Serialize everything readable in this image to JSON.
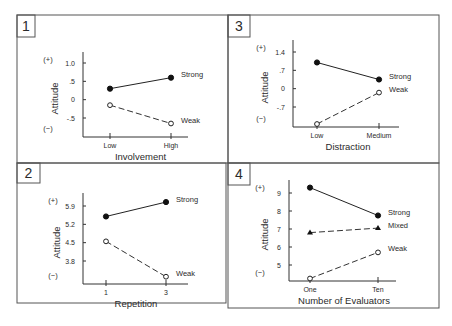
{
  "chart_data": [
    {
      "panel": "1",
      "type": "line",
      "categories": [
        "Low",
        "High"
      ],
      "xlabel": "Involvement",
      "ylabel": "Attitude",
      "y_pos_label": "(+)",
      "y_neg_label": "(−)",
      "yticks": [
        1.0,
        0.5,
        0,
        -0.5
      ],
      "ytick_labels": [
        "1.0",
        ".5",
        "0",
        "-.5"
      ],
      "ylim": [
        -0.85,
        1.4
      ],
      "series": [
        {
          "name": "Strong",
          "values": [
            0.3,
            0.6
          ],
          "marker": "filled-circle",
          "line": "solid"
        },
        {
          "name": "Weak",
          "values": [
            -0.15,
            -0.65
          ],
          "marker": "open-circle",
          "line": "dashed"
        }
      ]
    },
    {
      "panel": "3",
      "type": "line",
      "categories": [
        "Low",
        "Medium"
      ],
      "xlabel": "Distraction",
      "ylabel": "Attitude",
      "y_pos_label": "(+)",
      "y_neg_label": "(−)",
      "yticks": [
        1.4,
        0.7,
        0,
        -0.7
      ],
      "ytick_labels": [
        "1.4",
        ".7",
        "0",
        "-.7"
      ],
      "ylim": [
        -1.45,
        1.9
      ],
      "series": [
        {
          "name": "Strong",
          "values": [
            1.0,
            0.35
          ],
          "marker": "filled-circle",
          "line": "solid"
        },
        {
          "name": "Weak",
          "values": [
            -1.35,
            -0.15
          ],
          "marker": "open-circle",
          "line": "dashed"
        }
      ]
    },
    {
      "panel": "2",
      "type": "line",
      "categories": [
        "1",
        "3"
      ],
      "xlabel": "Repetition",
      "ylabel": "Attitude",
      "y_pos_label": "(+)",
      "y_neg_label": "(−)",
      "yticks": [
        5.9,
        5.2,
        4.5,
        3.8
      ],
      "ytick_labels": [
        "5.9",
        "5.2",
        "4.5",
        "3.8"
      ],
      "ylim": [
        3.0,
        6.4
      ],
      "series": [
        {
          "name": "Strong",
          "values": [
            5.5,
            6.05
          ],
          "marker": "filled-circle",
          "line": "solid"
        },
        {
          "name": "Weak",
          "values": [
            4.55,
            3.2
          ],
          "marker": "open-circle",
          "line": "dashed"
        }
      ]
    },
    {
      "panel": "4",
      "type": "line",
      "categories": [
        "One",
        "Ten"
      ],
      "xlabel": "Number of Evaluators",
      "ylabel": "Attitude",
      "y_pos_label": "(+)",
      "y_neg_label": "(−)",
      "yticks": [
        9,
        8,
        7,
        6,
        5
      ],
      "ytick_labels": [
        "9",
        "8",
        "7",
        "6",
        "5"
      ],
      "ylim": [
        4.1,
        9.7
      ],
      "series": [
        {
          "name": "Strong",
          "values": [
            9.3,
            7.75
          ],
          "marker": "filled-circle",
          "line": "solid"
        },
        {
          "name": "Mixed",
          "values": [
            6.8,
            7.05
          ],
          "marker": "filled-triangle",
          "line": "dashed"
        },
        {
          "name": "Weak",
          "values": [
            4.25,
            5.7
          ],
          "marker": "open-circle",
          "line": "dashed"
        }
      ]
    }
  ],
  "layout": {
    "panels": [
      {
        "num": "1",
        "box": [
          17,
          15,
          228,
          163
        ],
        "badge": [
          17,
          15,
          35,
          37
        ],
        "axis": {
          "x0": 83,
          "y0": 137,
          "x1": 188,
          "ytop": 52,
          "catx": [
            110,
            171
          ],
          "ypix": [
            [
              1.0,
              63
            ],
            [
              -0.5,
              118
            ]
          ]
        },
        "pm_x": 48,
        "ylabel_x": 58
      },
      {
        "num": "3",
        "box": [
          228,
          15,
          439,
          163
        ],
        "badge": [
          228,
          15,
          250,
          37
        ],
        "axis": {
          "x0": 293,
          "y0": 127,
          "x1": 399,
          "ytop": 40,
          "catx": [
            317,
            379
          ],
          "ypix": [
            [
              1.4,
              52
            ],
            [
              -0.7,
              107
            ]
          ]
        },
        "pm_x": 261,
        "ylabel_x": 268
      },
      {
        "num": "2",
        "box": [
          17,
          163,
          226,
          303
        ],
        "badge": [
          17,
          163,
          40,
          183
        ],
        "axis": {
          "x0": 83,
          "y0": 284,
          "x1": 188,
          "ytop": 193,
          "catx": [
            106,
            166
          ],
          "ypix": [
            [
              5.9,
              206
            ],
            [
              3.8,
              261
            ]
          ]
        },
        "pm_x": 53,
        "ylabel_x": 60
      },
      {
        "num": "4",
        "box": [
          228,
          163,
          439,
          308
        ],
        "badge": [
          228,
          163,
          250,
          185
        ],
        "axis": {
          "x0": 289,
          "y0": 281,
          "x1": 396,
          "ytop": 180,
          "catx": [
            310,
            378
          ],
          "ypix": [
            [
              9,
              193
            ],
            [
              5,
              265
            ]
          ]
        },
        "pm_x": 260,
        "ylabel_x": 268
      }
    ]
  }
}
